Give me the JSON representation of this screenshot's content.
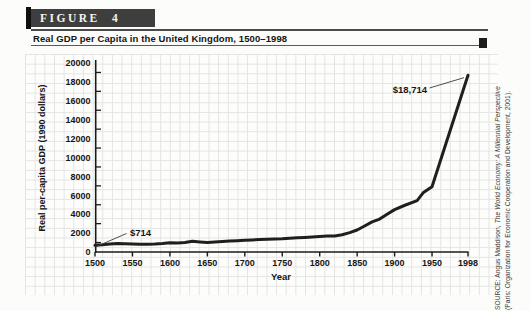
{
  "figure": {
    "label": "FIGURE 4",
    "title": "Real GDP per Capita in the United Kingdom, 1500–1998"
  },
  "source": {
    "line1_prefix": "SOURCE: Angus Maddison, ",
    "line1_italic": "The World Economy: A Millennial Perspective",
    "line2": "(Paris: Organization for Economic Cooperation and Development, 2001)."
  },
  "colors": {
    "header_box": "#3e3e3e",
    "accent_bar": "#101010",
    "curve": "#1f1f1f",
    "axis": "#1a1a1a",
    "grid": "#e4e4e2"
  },
  "chart_data": {
    "type": "line",
    "title": "Real GDP per Capita in the United Kingdom, 1500–1998",
    "xlabel": "Year",
    "ylabel": "Real per-capita GDP (1990 dollars)",
    "xlim": [
      1500,
      1998
    ],
    "ylim": [
      0,
      20000
    ],
    "x_ticks": [
      1500,
      1550,
      1600,
      1650,
      1700,
      1750,
      1800,
      1850,
      1900,
      1950,
      1998
    ],
    "y_ticks": [
      0,
      2000,
      4000,
      6000,
      8000,
      10000,
      12000,
      14000,
      16000,
      18000,
      20000
    ],
    "grid": "fine graph-paper grid, on",
    "legend": "none",
    "series": [
      {
        "name": "UK real GDP per capita (1990 dollars)",
        "points": [
          [
            1500,
            714
          ],
          [
            1510,
            760
          ],
          [
            1520,
            850
          ],
          [
            1530,
            900
          ],
          [
            1540,
            880
          ],
          [
            1550,
            860
          ],
          [
            1560,
            830
          ],
          [
            1570,
            820
          ],
          [
            1580,
            850
          ],
          [
            1590,
            900
          ],
          [
            1600,
            974
          ],
          [
            1610,
            960
          ],
          [
            1620,
            1020
          ],
          [
            1630,
            1130
          ],
          [
            1640,
            1060
          ],
          [
            1650,
            1000
          ],
          [
            1660,
            1060
          ],
          [
            1670,
            1100
          ],
          [
            1680,
            1150
          ],
          [
            1690,
            1200
          ],
          [
            1700,
            1250
          ],
          [
            1710,
            1280
          ],
          [
            1720,
            1310
          ],
          [
            1730,
            1340
          ],
          [
            1740,
            1370
          ],
          [
            1750,
            1400
          ],
          [
            1760,
            1450
          ],
          [
            1770,
            1500
          ],
          [
            1780,
            1550
          ],
          [
            1790,
            1600
          ],
          [
            1800,
            1650
          ],
          [
            1810,
            1680
          ],
          [
            1820,
            1706
          ],
          [
            1830,
            1820
          ],
          [
            1840,
            2050
          ],
          [
            1850,
            2330
          ],
          [
            1860,
            2750
          ],
          [
            1870,
            3190
          ],
          [
            1880,
            3480
          ],
          [
            1890,
            4000
          ],
          [
            1900,
            4490
          ],
          [
            1913,
            4921
          ],
          [
            1930,
            5440
          ],
          [
            1938,
            6266
          ],
          [
            1950,
            6907
          ],
          [
            1998,
            18714
          ]
        ]
      }
    ],
    "annotations": [
      {
        "text": "$714",
        "year": 1500,
        "value": 714
      },
      {
        "text": "$18,714",
        "year": 1998,
        "value": 18714
      }
    ]
  }
}
